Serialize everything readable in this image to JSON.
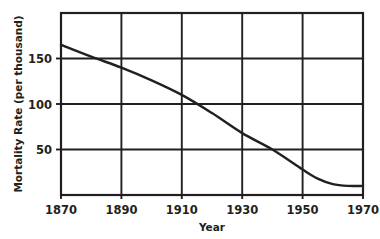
{
  "chart_data": {
    "type": "line",
    "title": "",
    "xlabel": "Year",
    "ylabel": "Mortality Rate (per thousand)",
    "xlim": [
      1870,
      1970
    ],
    "ylim": [
      0,
      200
    ],
    "grid": true,
    "legend": null,
    "x_ticks": [
      1870,
      1890,
      1910,
      1930,
      1950,
      1970
    ],
    "x_tick_labels": [
      "1870",
      "1890",
      "1910",
      "1930",
      "1950",
      "1970"
    ],
    "y_ticks": [
      50,
      100,
      150
    ],
    "y_tick_labels": [
      "50",
      "100",
      "150"
    ],
    "series": [
      {
        "name": "Mortality Rate",
        "color": "#231f20",
        "x": [
          1870,
          1880,
          1890,
          1900,
          1910,
          1920,
          1930,
          1940,
          1950,
          1955,
          1960,
          1965,
          1970
        ],
        "values": [
          165,
          152,
          140,
          126,
          110,
          90,
          68,
          50,
          28,
          18,
          12,
          10,
          10
        ]
      }
    ]
  },
  "axis_colors": {
    "frame": "#231f20",
    "grid": "#231f20",
    "curve": "#231f20",
    "background": "#ffffff"
  }
}
